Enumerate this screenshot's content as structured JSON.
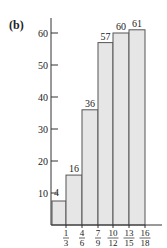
{
  "panel_label": "(b)",
  "colors": {
    "bar_fill": "#e6e6e6",
    "bar_stroke": "#555555",
    "axis": "#333333",
    "text": "#222222"
  },
  "chart_data": {
    "type": "bar",
    "title": "",
    "xlabel": "",
    "ylabel": "",
    "ylim": [
      0,
      65
    ],
    "yticks": [
      10,
      20,
      30,
      40,
      50,
      60
    ],
    "grid": false,
    "legend": null,
    "bin_edges_labels": [
      {
        "num": "1",
        "den": "3"
      },
      {
        "num": "4",
        "den": "6"
      },
      {
        "num": "7",
        "den": "9"
      },
      {
        "num": "10",
        "den": "12"
      },
      {
        "num": "13",
        "den": "15"
      },
      {
        "num": "16",
        "den": "18"
      }
    ],
    "categories": [
      "<1/3",
      "1/3–4/6",
      "4/6–7/9",
      "7/9–10/12",
      "10/12–13/15",
      "13/15–16/18"
    ],
    "values": [
      4,
      16,
      36,
      57,
      60,
      61
    ],
    "value_labels": [
      "4",
      "16",
      "36",
      "57",
      "60",
      "61"
    ],
    "visual_heights": [
      7.5,
      15.6,
      36,
      57,
      60,
      61
    ]
  }
}
